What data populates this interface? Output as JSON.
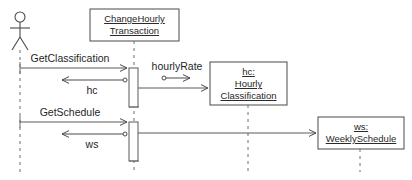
{
  "diagram": {
    "type": "uml-sequence-diagram",
    "background_color": "#ffffff",
    "line_color": "#4a4a4a",
    "text_color": "#1f1f1f",
    "lifeline_color": "#6e6e6e"
  },
  "participants": [
    {
      "id": "actor",
      "kind": "actor",
      "label": "",
      "lifeline_x": 20
    },
    {
      "id": "change_hourly_transaction",
      "kind": "object-box",
      "lines": [
        "ChangeHourly",
        "Transaction"
      ],
      "line1": "ChangeHourly",
      "line2": "Transaction",
      "lifeline_x": 134
    },
    {
      "id": "hourly_classification",
      "kind": "object-box",
      "lines": [
        "hc:",
        "Hourly",
        "Classification"
      ],
      "line1": "hc:",
      "line2": "Hourly",
      "line3": "Classification",
      "lifeline_x": 248
    },
    {
      "id": "weekly_schedule",
      "kind": "object-box",
      "lines": [
        "ws:",
        "WeeklySchedule"
      ],
      "line1": "ws:",
      "line2": "WeeklySchedule",
      "lifeline_x": 360
    }
  ],
  "messages": [
    {
      "id": "get_classification",
      "label": "GetClassification",
      "from": "actor",
      "to": "change_hourly_transaction",
      "direction": "right",
      "style": "call"
    },
    {
      "id": "hourly_rate",
      "label": "hourlyRate",
      "from": "change_hourly_transaction",
      "to": "hourly_classification",
      "direction": "right",
      "style": "call"
    },
    {
      "id": "hc_return",
      "label": "hc",
      "from": "change_hourly_transaction",
      "to": "actor",
      "direction": "left",
      "style": "return"
    },
    {
      "id": "get_schedule",
      "label": "GetSchedule",
      "from": "actor",
      "to": "change_hourly_transaction",
      "direction": "right",
      "style": "call"
    },
    {
      "id": "ws_return",
      "label": "ws",
      "from": "change_hourly_transaction",
      "to": "actor",
      "direction": "left",
      "style": "return"
    },
    {
      "id": "to_weekly_schedule",
      "label": "",
      "from": "change_hourly_transaction",
      "to": "weekly_schedule",
      "direction": "right",
      "style": "call"
    }
  ]
}
